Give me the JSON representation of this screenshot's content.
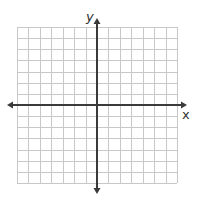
{
  "diagram": {
    "type": "coordinate-plane",
    "axes": {
      "x_label": "x",
      "y_label": "y",
      "arrows": "both-ends"
    },
    "grid": {
      "columns": 14,
      "rows": 14,
      "x_range": [
        -7,
        7
      ],
      "y_range": [
        -7,
        7
      ],
      "tick_labels": "none"
    },
    "colors": {
      "grid_line": "#c8c8c8",
      "axis_line": "#3a3a3a",
      "background": "#ffffff"
    }
  }
}
